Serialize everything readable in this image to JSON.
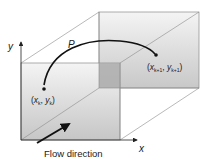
{
  "diagram": {
    "type": "3d-channel-particle-path",
    "axes": {
      "y_label": "y",
      "x_label": "x"
    },
    "path_label": "P",
    "start_point": {
      "label_x": "x",
      "label_x_sub": "k",
      "label_y": "y",
      "label_y_sub": "k"
    },
    "end_point": {
      "label_x": "x",
      "label_x_sub": "k+1",
      "label_y": "y",
      "label_y_sub": "k+1"
    },
    "flow_label": "Flow direction",
    "colors": {
      "face_top": "#f2f2f2",
      "face_bottom": "#c8c8c8",
      "overlap": "#a8a8a8",
      "edge": "#8a8a8a",
      "curve": "#111111"
    }
  }
}
